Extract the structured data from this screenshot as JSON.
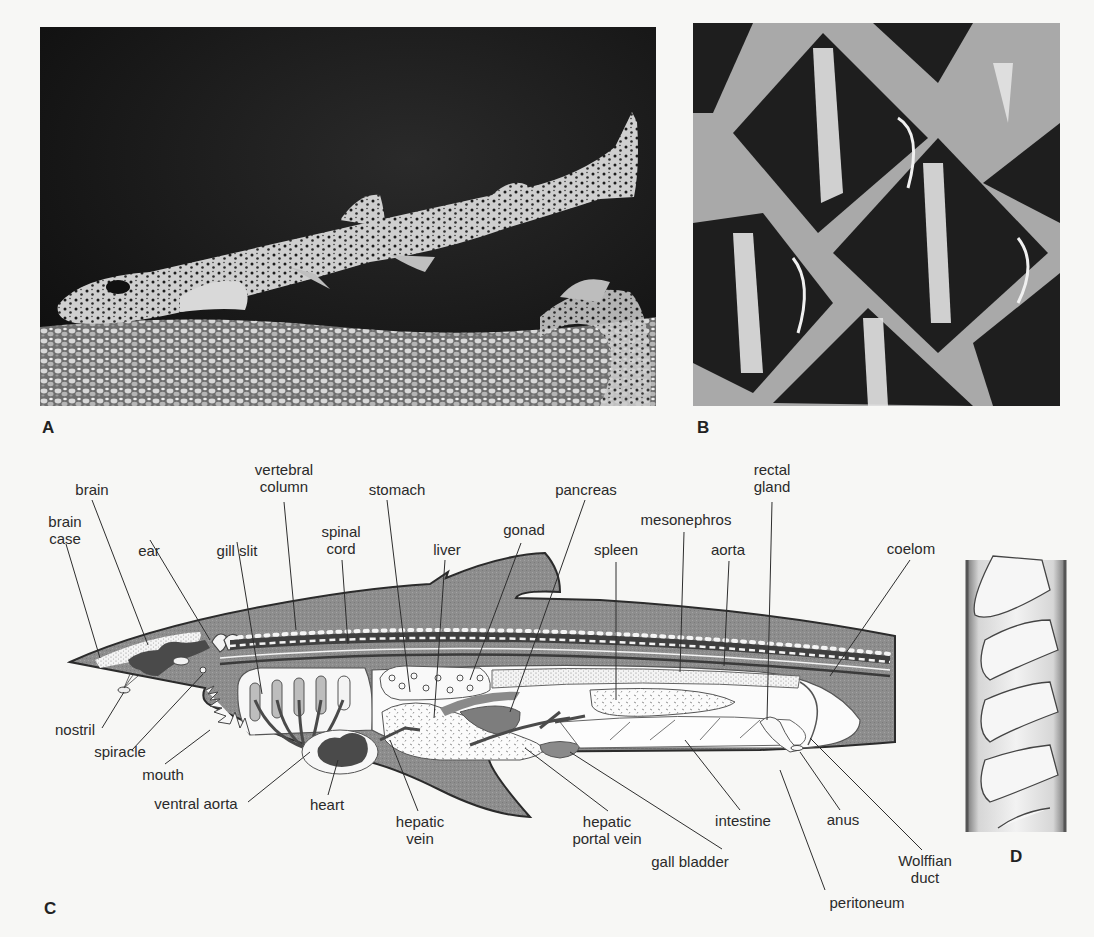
{
  "figure": {
    "panels": [
      {
        "id": "A",
        "label": "A",
        "description": "Photograph of a spotted dogfish (Scyliorhinus) resting above gravel"
      },
      {
        "id": "B",
        "label": "B",
        "description": "Close-up photograph of placoid scales (dermal denticles)"
      },
      {
        "id": "C",
        "label": "C",
        "description": "Longitudinal section diagram of a dogfish showing internal anatomy"
      },
      {
        "id": "D",
        "label": "D",
        "description": "Spiral valve of the intestine"
      }
    ],
    "anatomy_labels": {
      "brain": "brain",
      "brain_case_1": "brain",
      "brain_case_2": "case",
      "ear": "ear",
      "gill_slit": "gill slit",
      "vertebral_column_1": "vertebral",
      "vertebral_column_2": "column",
      "spinal_cord_1": "spinal",
      "spinal_cord_2": "cord",
      "stomach": "stomach",
      "liver": "liver",
      "gonad": "gonad",
      "pancreas": "pancreas",
      "spleen": "spleen",
      "mesonephros": "mesonephros",
      "aorta": "aorta",
      "rectal_gland_1": "rectal",
      "rectal_gland_2": "gland",
      "coelom": "coelom",
      "nostril": "nostril",
      "spiracle": "spiracle",
      "mouth": "mouth",
      "ventral_aorta": "ventral aorta",
      "heart": "heart",
      "hepatic_vein_1": "hepatic",
      "hepatic_vein_2": "vein",
      "hepatic_portal_vein_1": "hepatic",
      "hepatic_portal_vein_2": "portal vein",
      "gall_bladder": "gall bladder",
      "intestine": "intestine",
      "anus": "anus",
      "wolffian_duct_1": "Wolffian",
      "wolffian_duct_2": "duct",
      "peritoneum": "peritoneum"
    },
    "colors": {
      "background": "#f7f7f5",
      "tissue_gray": "#8e8e8e",
      "dark_organ": "#4a4a4a",
      "outline": "#2b2b2b",
      "photo_dark": "#141414"
    }
  }
}
